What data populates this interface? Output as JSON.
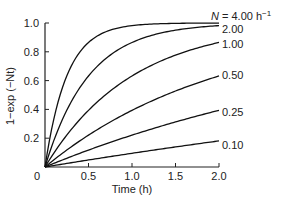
{
  "chart_data": {
    "type": "line",
    "title": "",
    "xlabel": "Time (h)",
    "ylabel": "1−exp (−Nt)",
    "xlim": [
      0,
      2.0
    ],
    "ylim": [
      0,
      1.0
    ],
    "grid": false,
    "legend_position": "inline-right",
    "x_ticks": [
      {
        "value": 0,
        "label": "0"
      },
      {
        "value": 0.5,
        "label": "0.5"
      },
      {
        "value": 1.0,
        "label": "1.0"
      },
      {
        "value": 1.5,
        "label": "1.5"
      },
      {
        "value": 2.0,
        "label": "2.0"
      }
    ],
    "y_ticks": [
      {
        "value": 0.2,
        "label": "0.2"
      },
      {
        "value": 0.4,
        "label": "0.4"
      },
      {
        "value": 0.6,
        "label": "0.6"
      },
      {
        "value": 0.8,
        "label": "0.8"
      },
      {
        "value": 1.0,
        "label": "1.0"
      }
    ],
    "x": [
      0,
      0.1,
      0.2,
      0.3,
      0.4,
      0.5,
      0.6,
      0.7,
      0.8,
      0.9,
      1.0,
      1.1,
      1.2,
      1.3,
      1.4,
      1.5,
      1.6,
      1.7,
      1.8,
      1.9,
      2.0
    ],
    "series": [
      {
        "name": "N = 4.00 h⁻¹",
        "label": "N = 4.00 h⁻¹",
        "N": 4.0,
        "values": [
          0,
          0.33,
          0.551,
          0.699,
          0.798,
          0.865,
          0.909,
          0.939,
          0.959,
          0.973,
          0.982,
          0.988,
          0.992,
          0.994,
          0.996,
          0.998,
          0.998,
          0.999,
          0.999,
          1.0,
          1.0
        ]
      },
      {
        "name": "2.00",
        "label": "2.00",
        "N": 2.0,
        "values": [
          0,
          0.181,
          0.33,
          0.451,
          0.551,
          0.632,
          0.699,
          0.753,
          0.798,
          0.835,
          0.865,
          0.889,
          0.909,
          0.926,
          0.939,
          0.95,
          0.959,
          0.967,
          0.973,
          0.978,
          0.982
        ]
      },
      {
        "name": "1.00",
        "label": "1.00",
        "N": 1.0,
        "values": [
          0,
          0.095,
          0.181,
          0.259,
          0.33,
          0.393,
          0.451,
          0.503,
          0.551,
          0.593,
          0.632,
          0.667,
          0.699,
          0.727,
          0.753,
          0.777,
          0.798,
          0.817,
          0.835,
          0.85,
          0.865
        ]
      },
      {
        "name": "0.50",
        "label": "0.50",
        "N": 0.5,
        "values": [
          0,
          0.049,
          0.095,
          0.139,
          0.181,
          0.221,
          0.259,
          0.295,
          0.33,
          0.362,
          0.393,
          0.423,
          0.451,
          0.478,
          0.503,
          0.528,
          0.551,
          0.573,
          0.593,
          0.613,
          0.632
        ]
      },
      {
        "name": "0.25",
        "label": "0.25",
        "N": 0.25,
        "values": [
          0,
          0.025,
          0.049,
          0.072,
          0.095,
          0.118,
          0.139,
          0.161,
          0.181,
          0.201,
          0.221,
          0.24,
          0.259,
          0.277,
          0.295,
          0.313,
          0.33,
          0.346,
          0.362,
          0.378,
          0.393
        ]
      },
      {
        "name": "0.10",
        "label": "0.10",
        "N": 0.1,
        "values": [
          0,
          0.01,
          0.02,
          0.03,
          0.039,
          0.049,
          0.058,
          0.068,
          0.077,
          0.086,
          0.095,
          0.104,
          0.113,
          0.122,
          0.131,
          0.139,
          0.148,
          0.156,
          0.165,
          0.173,
          0.181
        ]
      }
    ],
    "formula": "y = 1 − exp(−N t)"
  },
  "labels": {
    "xlabel": "Time (h)",
    "ylabel": "1−exp (−Nt)",
    "origin": "0",
    "series_prefix_N": "N",
    "series_first_rest": " = 4.00 h",
    "series_first_sup": "−1"
  },
  "colors": {
    "line": "#111111",
    "axis": "#222222",
    "text": "#222222",
    "background": "#ffffff"
  }
}
